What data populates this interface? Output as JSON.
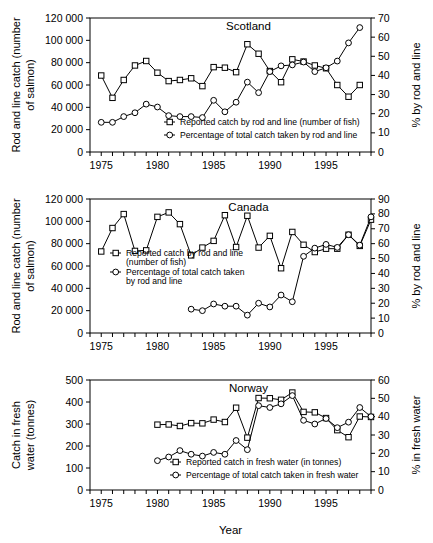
{
  "figure": {
    "xlabel": "Year",
    "xlim": [
      1974,
      1999
    ],
    "xticks": [
      1975,
      1980,
      1985,
      1990,
      1995
    ],
    "xtick_step": 1
  },
  "chart_data": [
    {
      "type": "line",
      "title": "Scotland",
      "xlabel": "",
      "ylabel": "Rod and line catch (number of salmon)",
      "ylabel_right": "% by rod and line",
      "xlim": [
        1974,
        1999
      ],
      "ylim": [
        0,
        120000
      ],
      "ylim_right": [
        0,
        70
      ],
      "yticks": [
        "0",
        "20 000",
        "40 000",
        "60 000",
        "80 000",
        "100 000",
        "120 000"
      ],
      "ytick_values": [
        0,
        20000,
        40000,
        60000,
        80000,
        100000,
        120000
      ],
      "yticks_right": [
        "0",
        "10",
        "20",
        "30",
        "40",
        "50",
        "60",
        "70"
      ],
      "ytick_values_right": [
        0,
        10,
        20,
        30,
        40,
        50,
        60,
        70
      ],
      "grid": false,
      "legend_position": "inside-bottom-right",
      "series": [
        {
          "name": "Reported catch by rod and line (number of fish)",
          "marker": "square",
          "axis": "left",
          "x": [
            1975,
            1976,
            1977,
            1978,
            1979,
            1980,
            1981,
            1982,
            1983,
            1984,
            1985,
            1986,
            1987,
            1988,
            1989,
            1990,
            1991,
            1992,
            1993,
            1994,
            1995,
            1996,
            1997,
            1998
          ],
          "values": [
            68500,
            48500,
            64500,
            77500,
            81500,
            71000,
            63500,
            64500,
            66000,
            59000,
            76000,
            75500,
            71500,
            96500,
            88000,
            72500,
            62500,
            83000,
            81000,
            77500,
            75000,
            60000,
            49500,
            60000
          ]
        },
        {
          "name": "Percentage of total catch taken by rod and line",
          "marker": "circle",
          "axis": "right",
          "x": [
            1975,
            1976,
            1977,
            1978,
            1979,
            1980,
            1981,
            1982,
            1983,
            1984,
            1985,
            1986,
            1987,
            1988,
            1989,
            1990,
            1991,
            1992,
            1993,
            1994,
            1995,
            1996,
            1997,
            1998
          ],
          "values": [
            15.5,
            15.5,
            18.5,
            20.5,
            25,
            23.5,
            19,
            18.5,
            18.5,
            18,
            27,
            21,
            26,
            36.5,
            31,
            42,
            45,
            45.5,
            47,
            42,
            44,
            47.5,
            57,
            65
          ]
        }
      ]
    },
    {
      "type": "line",
      "title": "Canada",
      "xlabel": "",
      "ylabel": "Rod and line catch (number of salmon)",
      "ylabel_right": "% by rod and line",
      "xlim": [
        1974,
        1999
      ],
      "ylim": [
        0,
        120000
      ],
      "ylim_right": [
        0,
        90
      ],
      "yticks": [
        "0",
        "20 000",
        "40 000",
        "60 000",
        "80 000",
        "100 000",
        "120 000"
      ],
      "ytick_values": [
        0,
        20000,
        40000,
        60000,
        80000,
        100000,
        120000
      ],
      "yticks_right": [
        "0",
        "10",
        "20",
        "30",
        "40",
        "50",
        "60",
        "70",
        "80",
        "90"
      ],
      "ytick_values_right": [
        0,
        10,
        20,
        30,
        40,
        50,
        60,
        70,
        80,
        90
      ],
      "grid": false,
      "legend_position": "inside-left",
      "series": [
        {
          "name": "Reported catch by rod and line (number of fish)",
          "marker": "square",
          "axis": "left",
          "x": [
            1975,
            1976,
            1977,
            1978,
            1979,
            1980,
            1981,
            1982,
            1983,
            1984,
            1985,
            1986,
            1987,
            1988,
            1989,
            1990,
            1991,
            1992,
            1993,
            1994,
            1995,
            1996,
            1997,
            1998,
            1999
          ],
          "values": [
            73000,
            94000,
            106500,
            73500,
            74000,
            104000,
            108000,
            97500,
            69500,
            76500,
            82500,
            105500,
            77000,
            105000,
            76500,
            87000,
            58000,
            90500,
            79000,
            72500,
            75500,
            75500,
            88000,
            78000,
            101500
          ]
        },
        {
          "name": "Percentage of total catch taken by rod and line",
          "marker": "circle",
          "axis": "right",
          "x": [
            1983,
            1984,
            1985,
            1986,
            1987,
            1988,
            1989,
            1990,
            1991,
            1992,
            1993,
            1994,
            1995,
            1996,
            1997,
            1998,
            1999
          ],
          "values": [
            16,
            15,
            19.5,
            18,
            18,
            12,
            20,
            17.5,
            25.5,
            21,
            51.5,
            57,
            59.5,
            57.5,
            66,
            59,
            78
          ]
        }
      ]
    },
    {
      "type": "line",
      "title": "Norway",
      "xlabel": "Year",
      "ylabel": "Catch in fresh water (tonnes)",
      "ylabel_right": "% in fresh water",
      "xlim": [
        1974,
        1999
      ],
      "ylim": [
        0,
        500
      ],
      "ylim_right": [
        0,
        60
      ],
      "yticks": [
        "0",
        "100",
        "200",
        "300",
        "400",
        "500"
      ],
      "ytick_values": [
        0,
        100,
        200,
        300,
        400,
        500
      ],
      "yticks_right": [
        "0",
        "10",
        "20",
        "30",
        "40",
        "50",
        "60"
      ],
      "ytick_values_right": [
        0,
        10,
        20,
        30,
        40,
        50,
        60
      ],
      "grid": false,
      "legend_position": "inside-bottom-center",
      "series": [
        {
          "name": "Reported catch in fresh water (in tonnes)",
          "marker": "square",
          "axis": "left",
          "x": [
            1980,
            1981,
            1982,
            1983,
            1984,
            1985,
            1986,
            1987,
            1988,
            1989,
            1990,
            1991,
            1992,
            1993,
            1994,
            1995,
            1996,
            1997,
            1998,
            1999
          ],
          "values": [
            297,
            298,
            291,
            304,
            303,
            320,
            309,
            374,
            238,
            418,
            417,
            410,
            443,
            355,
            353,
            327,
            272,
            240,
            334,
            332
          ]
        },
        {
          "name": "Percentage of total catch taken in fresh water",
          "marker": "circle",
          "axis": "right",
          "x": [
            1980,
            1981,
            1982,
            1983,
            1984,
            1985,
            1986,
            1987,
            1988,
            1989,
            1990,
            1991,
            1992,
            1993,
            1994,
            1995,
            1996,
            1997,
            1998,
            1999
          ],
          "values": [
            16,
            18,
            21.5,
            19.5,
            18.5,
            20.5,
            19.5,
            27,
            22,
            46,
            45,
            47,
            51.5,
            38,
            36,
            39,
            34,
            37,
            45,
            40
          ]
        }
      ]
    }
  ]
}
